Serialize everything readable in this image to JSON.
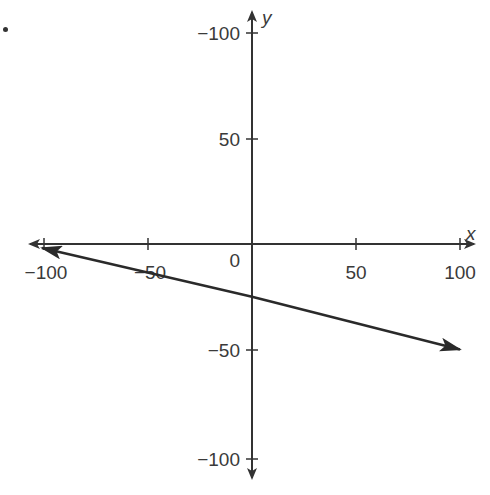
{
  "bullet": "•",
  "chart_data": {
    "type": "line",
    "title": "",
    "xlabel": "x",
    "ylabel": "y",
    "xlim": [
      -100,
      100
    ],
    "ylim": [
      -100,
      100
    ],
    "grid": false,
    "x_ticks": [
      -100,
      -50,
      50,
      100
    ],
    "x_tick_labels": [
      "−100",
      "−50",
      "50",
      "100"
    ],
    "y_ticks": [
      100,
      50,
      -50,
      -100
    ],
    "y_tick_labels": [
      "−100",
      "50",
      "−50",
      "−100"
    ],
    "origin_label": "0",
    "series": [
      {
        "name": "line",
        "x": [
          -100,
          0,
          100
        ],
        "y": [
          0,
          -25,
          -50
        ],
        "arrows": "both"
      }
    ]
  },
  "colors": {
    "axis": "#333333",
    "line": "#2a2a2a"
  }
}
